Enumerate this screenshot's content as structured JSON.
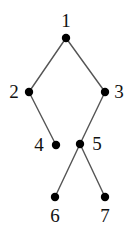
{
  "figure": {
    "name": "binary-tree-diagram",
    "background_color": "#ffffff",
    "node_color": "#000000",
    "edge_color": "#555555",
    "label_color": "#111111"
  },
  "graph": {
    "type": "tree",
    "nodes": [
      {
        "id": "1",
        "label": "1",
        "x": 66,
        "y": 38,
        "label_x": 66,
        "label_y": 21,
        "label_pos": "above"
      },
      {
        "id": "2",
        "label": "2",
        "x": 29,
        "y": 92,
        "label_x": 14,
        "label_y": 92,
        "label_pos": "left"
      },
      {
        "id": "3",
        "label": "3",
        "x": 105,
        "y": 92,
        "label_x": 119,
        "label_y": 92,
        "label_pos": "right"
      },
      {
        "id": "4",
        "label": "4",
        "x": 56,
        "y": 145,
        "label_x": 39,
        "label_y": 145,
        "label_pos": "left"
      },
      {
        "id": "5",
        "label": "5",
        "x": 80,
        "y": 144,
        "label_x": 97,
        "label_y": 144,
        "label_pos": "right"
      },
      {
        "id": "6",
        "label": "6",
        "x": 55,
        "y": 197,
        "label_x": 55,
        "label_y": 216,
        "label_pos": "below"
      },
      {
        "id": "7",
        "label": "7",
        "x": 105,
        "y": 197,
        "label_x": 105,
        "label_y": 216,
        "label_pos": "below"
      }
    ],
    "edges": [
      {
        "from": "1",
        "to": "2"
      },
      {
        "from": "1",
        "to": "3"
      },
      {
        "from": "2",
        "to": "4"
      },
      {
        "from": "3",
        "to": "5"
      },
      {
        "from": "5",
        "to": "6"
      },
      {
        "from": "5",
        "to": "7"
      }
    ],
    "node_radius": 4.2,
    "edge_width": 1.4
  }
}
